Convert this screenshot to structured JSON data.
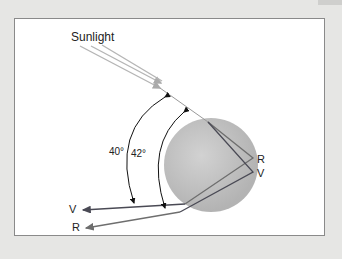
{
  "diagram": {
    "title_label": "Sunlight",
    "angle_outer": "40°",
    "angle_inner": "42°",
    "exit_labels": {
      "red_inside": "R",
      "violet_inside": "V",
      "violet_out": "V",
      "red_out": "R"
    },
    "colors": {
      "background": "#e6e6e4",
      "panel": "#ffffff",
      "drop": "#bdbdbd",
      "sunlight": "#b5b5b5",
      "violet_ray": "#4a4a55",
      "red_ray": "#6e6e6e"
    }
  }
}
